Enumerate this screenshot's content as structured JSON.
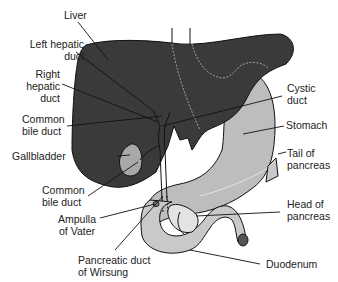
{
  "figure": {
    "type": "anatomical-diagram",
    "colors": {
      "liver": "#3a3a3a",
      "stomach": "#bdbdbd",
      "pancreas_duodenum": "#c9c9c9",
      "gallbladder": "#a8a8a8",
      "outline": "#111111",
      "leader_line": "#111111",
      "background": "#ffffff"
    }
  },
  "labels": {
    "liver": "Liver",
    "left_hepatic_duct": [
      "Left hepatic",
      "duct"
    ],
    "right_hepatic_duct": [
      "Right",
      "hepatic",
      "duct"
    ],
    "common_bile_duct_upper": [
      "Common",
      "bile duct"
    ],
    "gallbladder": "Gallbladder",
    "common_bile_duct_lower": [
      "Common",
      "bile duct"
    ],
    "ampulla_of_vater": [
      "Ampulla",
      "of Vater"
    ],
    "pancreatic_duct_of_wirsung": [
      "Pancreatic duct",
      "of Wirsung"
    ],
    "cystic_duct": [
      "Cystic",
      "duct"
    ],
    "stomach": "Stomach",
    "tail_of_pancreas": [
      "Tail of",
      "pancreas"
    ],
    "head_of_pancreas": [
      "Head of",
      "pancreas"
    ],
    "duodenum": "Duodenum"
  }
}
